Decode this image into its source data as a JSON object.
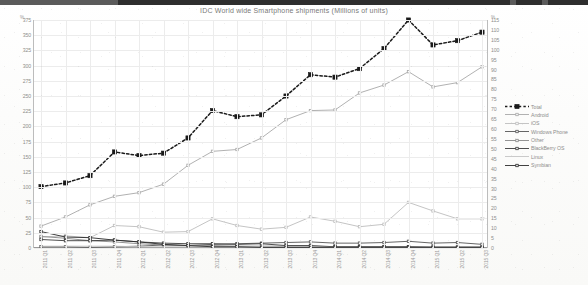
{
  "window": {
    "chrome_strip": true
  },
  "chart_data": {
    "type": "line",
    "title": "IDC  World wide Smartphone shipments (Millions of units)",
    "xlabel": "",
    "ylabel": "",
    "ylabel_left_unit": "%",
    "ylabel_right_unit": "%",
    "grid": true,
    "legend_position": "right",
    "ylim": [
      0,
      375
    ],
    "ylim_right": [
      0,
      115
    ],
    "yticks": [
      0,
      25,
      50,
      75,
      100,
      125,
      150,
      175,
      200,
      225,
      250,
      275,
      300,
      325,
      350,
      375
    ],
    "yticks_right": [
      0,
      5,
      10,
      15,
      20,
      25,
      30,
      35,
      40,
      45,
      50,
      55,
      60,
      65,
      70,
      75,
      80,
      85,
      90,
      95,
      100,
      105,
      110,
      115
    ],
    "categories": [
      "2011 Q1",
      "2011 Q2",
      "2011 Q3",
      "2011 Q4",
      "2012 Q1",
      "2012 Q2",
      "2012 Q3",
      "2012 Q4",
      "2013 Q1",
      "2013 Q2",
      "2013 Q3",
      "2013 Q4",
      "2014 Q1",
      "2014 Q2",
      "2014 Q3",
      "2014 Q4",
      "2015 Q1",
      "2015 Q2",
      "2015 Q3"
    ],
    "series": [
      {
        "name": "Total",
        "color": "#1a1a1a",
        "style": "dotted-marker",
        "axis": "left",
        "values": [
          101,
          107,
          119,
          158,
          152,
          156,
          181,
          226,
          216,
          219,
          250,
          285,
          281,
          295,
          328,
          375,
          334,
          341,
          355
        ]
      },
      {
        "name": "Android",
        "color": "#a8a8a8",
        "style": "solid-marker",
        "axis": "left",
        "values": [
          36,
          51,
          71,
          85,
          91,
          105,
          136,
          159,
          162,
          181,
          211,
          226,
          227,
          255,
          268,
          290,
          265,
          272,
          298
        ]
      },
      {
        "name": "iOS",
        "color": "#bdbdbd",
        "style": "solid-marker",
        "axis": "left",
        "values": [
          18,
          20,
          17,
          37,
          35,
          26,
          27,
          48,
          37,
          31,
          34,
          51,
          44,
          35,
          39,
          75,
          61,
          48,
          48
        ]
      },
      {
        "name": "Windows Phone",
        "color": "#555555",
        "style": "solid-marker",
        "axis": "left",
        "values": [
          2,
          2,
          1,
          2,
          3,
          5,
          4,
          6,
          7,
          8,
          9,
          10,
          8,
          8,
          9,
          11,
          8,
          9,
          6
        ]
      },
      {
        "name": "Other",
        "color": "#888888",
        "style": "solid-marker",
        "axis": "left",
        "values": [
          19,
          16,
          12,
          10,
          7,
          5,
          4,
          4,
          3,
          3,
          3,
          3,
          2,
          2,
          2,
          2,
          2,
          2,
          2
        ]
      },
      {
        "name": "BlackBerry OS",
        "color": "#3a3a3a",
        "style": "solid-marker",
        "axis": "left",
        "values": [
          14,
          12,
          12,
          13,
          10,
          8,
          7,
          7,
          6,
          7,
          4,
          4,
          2,
          2,
          2,
          2,
          1,
          1,
          1
        ]
      },
      {
        "name": "Linux",
        "color": "#c4c4c4",
        "style": "solid",
        "axis": "left",
        "values": [
          3,
          3,
          3,
          3,
          2,
          2,
          2,
          2,
          2,
          2,
          2,
          2,
          1,
          1,
          1,
          1,
          1,
          1,
          1
        ]
      },
      {
        "name": "Symbian",
        "color": "#2b2b2b",
        "style": "solid-marker",
        "axis": "left",
        "values": [
          27,
          18,
          17,
          13,
          10,
          6,
          4,
          2,
          2,
          1,
          1,
          1,
          1,
          1,
          1,
          1,
          1,
          1,
          1
        ]
      }
    ]
  }
}
